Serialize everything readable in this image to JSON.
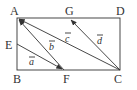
{
  "diagram": {
    "type": "geometry-rectangle-vectors",
    "shape": "rectangle ABCD",
    "points": [
      {
        "label": "A",
        "x": 17,
        "y": 18,
        "lx": 10,
        "ly": 15
      },
      {
        "label": "G",
        "x": 70,
        "y": 18,
        "lx": 65,
        "ly": 15
      },
      {
        "label": "D",
        "x": 120,
        "y": 18,
        "lx": 116,
        "ly": 15
      },
      {
        "label": "E",
        "x": 17,
        "y": 44,
        "lx": 5,
        "ly": 49
      },
      {
        "label": "B",
        "x": 17,
        "y": 70,
        "lx": 13,
        "ly": 83
      },
      {
        "label": "F",
        "x": 64,
        "y": 70,
        "lx": 63,
        "ly": 83
      },
      {
        "label": "C",
        "x": 120,
        "y": 70,
        "lx": 114,
        "ly": 83
      }
    ],
    "vectors": [
      {
        "name": "a",
        "from": "E",
        "to": "F",
        "lx": 29,
        "ly": 65
      },
      {
        "name": "b",
        "from": "F",
        "to": "A",
        "lx": 49,
        "ly": 50
      },
      {
        "name": "c",
        "from": "C",
        "to": "A",
        "lx": 65,
        "ly": 42
      },
      {
        "name": "d",
        "from": "C",
        "to": "G",
        "lx": 97,
        "ly": 44
      }
    ],
    "colors": {
      "ink": "#333333",
      "background": "#ffffff"
    }
  }
}
